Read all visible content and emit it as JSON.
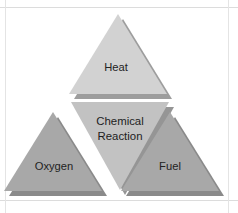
{
  "diagram": {
    "type": "fire-triangle",
    "background_color": "#ffffff",
    "frame_color": "#d9d9d9",
    "label_color": "#232323",
    "elements": [
      {
        "id": "heat",
        "label": "Heat",
        "position": "top",
        "shape": "triangle-up",
        "fill": "#d2d2d2",
        "shadow": "#9d9d9d"
      },
      {
        "id": "oxygen",
        "label": "Oxygen",
        "position": "bottom-left",
        "shape": "triangle-up",
        "fill": "#a8a8a8",
        "shadow": "#8a8a8a"
      },
      {
        "id": "fuel",
        "label": "Fuel",
        "position": "bottom-right",
        "shape": "triangle-up",
        "fill": "#a8a8a8",
        "shadow": "#8a8a8a"
      },
      {
        "id": "chemical-reaction",
        "label_line_1": "Chemical",
        "label_line_2": "Reaction",
        "position": "center",
        "shape": "triangle-down",
        "fill": "#c2c2c2",
        "shadow": "#959595"
      }
    ]
  }
}
